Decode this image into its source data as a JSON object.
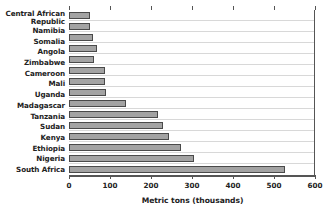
{
  "chart_data": {
    "type": "bar",
    "orientation": "horizontal",
    "title": "",
    "xlabel": "Metric tons (thousands)",
    "ylabel": "",
    "xlim": [
      0,
      600
    ],
    "xticks": [
      0,
      100,
      200,
      300,
      400,
      500,
      600
    ],
    "xtick_labels": [
      "0",
      "100",
      "200",
      "300",
      "400",
      "500",
      "600"
    ],
    "grid": "horizontal row separators only",
    "legend": "none",
    "bar_color": "#a3a3a3",
    "bar_edge_color": "#4a4a4a",
    "categories": [
      "Central African\nRepublic",
      "Namibia",
      "Somalia",
      "Angola",
      "Zimbabwe",
      "Cameroon",
      "Mali",
      "Uganda",
      "Madagascar",
      "Tanzania",
      "Sudan",
      "Kenya",
      "Ethiopia",
      "Nigeria",
      "South Africa"
    ],
    "values": [
      50,
      52,
      58,
      68,
      61,
      88,
      88,
      90,
      140,
      216,
      230,
      245,
      273,
      305,
      527
    ]
  }
}
